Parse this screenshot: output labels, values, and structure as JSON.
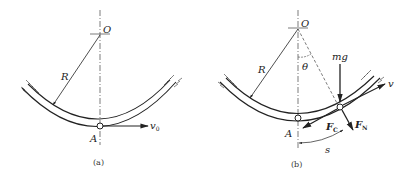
{
  "figure_a": {
    "caption": "(a)",
    "labels": {
      "center": "O",
      "radius": "R",
      "point": "A",
      "velocity": "v",
      "velocity_sub": "0"
    }
  },
  "figure_b": {
    "caption": "(b)",
    "labels": {
      "center": "O",
      "radius": "R",
      "angle": "θ",
      "point": "A",
      "weight": "mg",
      "velocity": "v",
      "friction": "F",
      "friction_sub": "C",
      "normal": "F",
      "normal_sub": "N",
      "arc": "s"
    }
  },
  "colors": {
    "ink": "#222222",
    "background": "#ffffff"
  }
}
